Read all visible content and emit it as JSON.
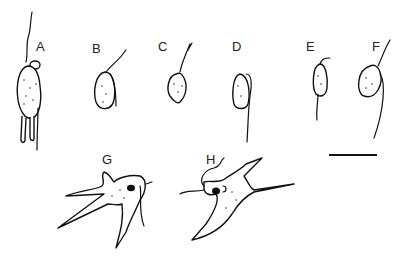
{
  "figure": {
    "panels": [
      {
        "id": "A",
        "label": "A"
      },
      {
        "id": "B",
        "label": "B"
      },
      {
        "id": "C",
        "label": "C"
      },
      {
        "id": "D",
        "label": "D"
      },
      {
        "id": "E",
        "label": "E"
      },
      {
        "id": "F",
        "label": "F"
      },
      {
        "id": "G",
        "label": "G"
      },
      {
        "id": "H",
        "label": "H"
      }
    ],
    "scale_bar": {
      "visible": true
    }
  }
}
